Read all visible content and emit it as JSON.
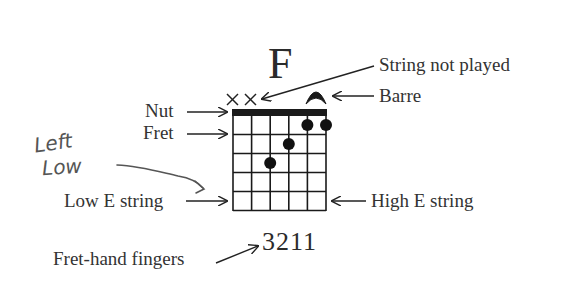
{
  "diagram": {
    "chord_name": "F",
    "labels": {
      "string_not_played": "String not played",
      "barre": "Barre",
      "nut": "Nut",
      "fret": "Fret",
      "low_e_string": "Low E string",
      "high_e_string": "High E string",
      "fret_hand_fingers": "Fret-hand fingers"
    },
    "fingering": "3211",
    "handwritten_note": {
      "line1": "Left",
      "line2": "Low"
    },
    "fretboard": {
      "strings": 6,
      "frets": 5,
      "muted_strings": [
        1,
        2
      ],
      "barre": {
        "fret": 1,
        "from_string": 5,
        "to_string": 6
      },
      "dots": [
        {
          "string": 5,
          "fret": 1
        },
        {
          "string": 6,
          "fret": 1
        },
        {
          "string": 4,
          "fret": 2
        },
        {
          "string": 3,
          "fret": 3
        }
      ]
    },
    "colors": {
      "ink": "#1a1a1a",
      "text": "#333333",
      "pencil": "#555555"
    }
  }
}
